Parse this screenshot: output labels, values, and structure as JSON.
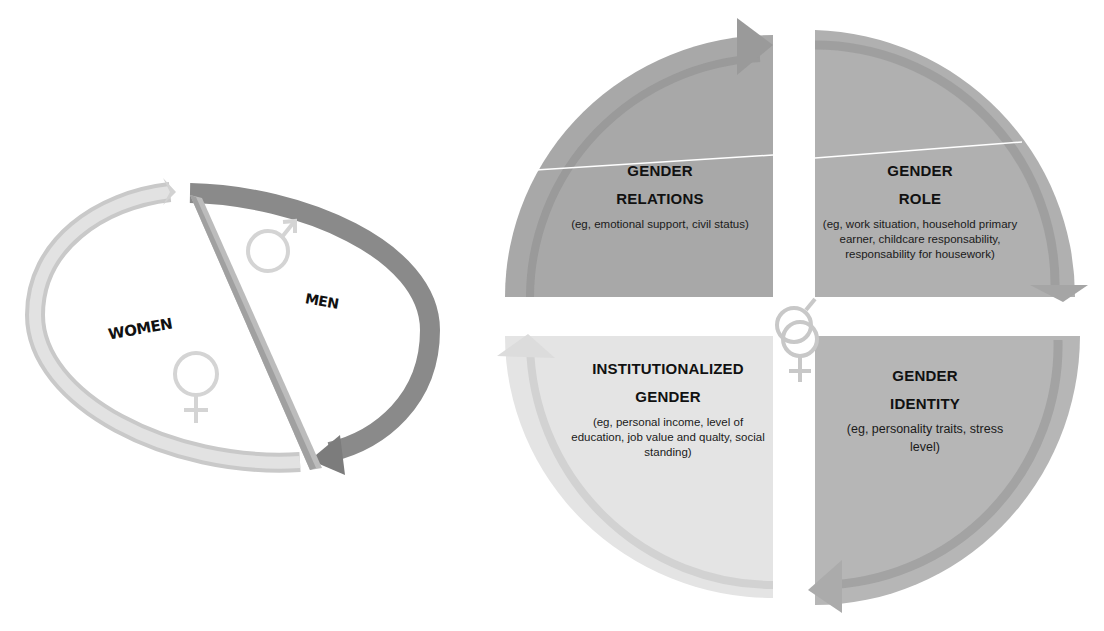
{
  "left_diagram": {
    "women_label": "WOMEN",
    "men_label": "MEN",
    "women_symbol": "♀",
    "men_symbol": "♂",
    "colors": {
      "women_arrow": "#cfcfcf",
      "men_arrow": "#8a8a8a",
      "divider": "#b5b5b5"
    }
  },
  "quadrants": [
    {
      "id": "relations",
      "title1": "GENDER",
      "title2": "RELATIONS",
      "desc": "(eg, emotional support, civil status)",
      "color": "#a9a9a9"
    },
    {
      "id": "role",
      "title1": "GENDER",
      "title2": "ROLE",
      "desc": "(eg, work situation, household primary earner, childcare responsability, responsability for housework)",
      "color": "#b1b1b1"
    },
    {
      "id": "institutionalized",
      "title1": "INSTITUTIONALIZED",
      "title2": "GENDER",
      "desc": "(eg, personal income, level of education, job value and qualty, social standing)",
      "color": "#e3e3e3"
    },
    {
      "id": "identity",
      "title1": "GENDER",
      "title2": "IDENTITY",
      "desc": "(eg, personality traits, stress level)",
      "color": "#b7b7b7"
    }
  ],
  "center_symbol": "⚥"
}
